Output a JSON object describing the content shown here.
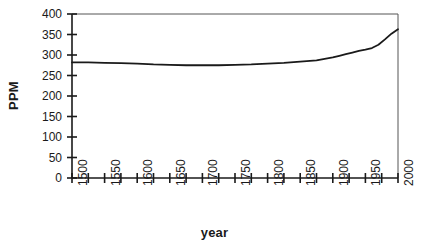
{
  "chart_data": {
    "type": "line",
    "title": "",
    "xlabel": "year",
    "ylabel": "PPM",
    "xlim": [
      1500,
      2000
    ],
    "ylim": [
      0,
      400
    ],
    "grid": false,
    "legend": null,
    "x_major_step": 50,
    "x_minor_step": 25,
    "y_major_step": 50,
    "xticks": [
      1500,
      1550,
      1600,
      1650,
      1700,
      1750,
      1800,
      1850,
      1900,
      1950,
      2000
    ],
    "xtick_labels": [
      "1500",
      "1550",
      "1600",
      "1650",
      "1700",
      "1750",
      "1800",
      "1850",
      "1900",
      "1950",
      "2000"
    ],
    "yticks": [
      0,
      50,
      100,
      150,
      200,
      250,
      300,
      350,
      400
    ],
    "ytick_labels": [
      "0",
      "50",
      "100",
      "150",
      "200",
      "250",
      "300",
      "350",
      "400"
    ],
    "series": [
      {
        "name": "CO2 concentration",
        "color": "#1a1a1a",
        "x": [
          1500,
          1525,
          1550,
          1575,
          1600,
          1625,
          1650,
          1675,
          1700,
          1725,
          1750,
          1775,
          1800,
          1825,
          1850,
          1875,
          1900,
          1910,
          1920,
          1930,
          1940,
          1950,
          1960,
          1970,
          1980,
          1990,
          2000
        ],
        "y": [
          282,
          282,
          281,
          280,
          279,
          277,
          276,
          275,
          275,
          275,
          276,
          277,
          279,
          281,
          284,
          287,
          294,
          298,
          302,
          306,
          310,
          313,
          317,
          325,
          338,
          352,
          363
        ]
      }
    ]
  },
  "axis": {
    "ylabel_text": "PPM",
    "xlabel_text": "year"
  }
}
